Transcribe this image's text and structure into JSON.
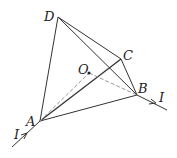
{
  "diagram": {
    "labels": {
      "D": "D",
      "C": "C",
      "O": "O",
      "B": "B",
      "A": "A",
      "I_in": "I",
      "I_out": "I"
    },
    "colors": {
      "line": "#333333",
      "dashed": "#999999"
    }
  }
}
